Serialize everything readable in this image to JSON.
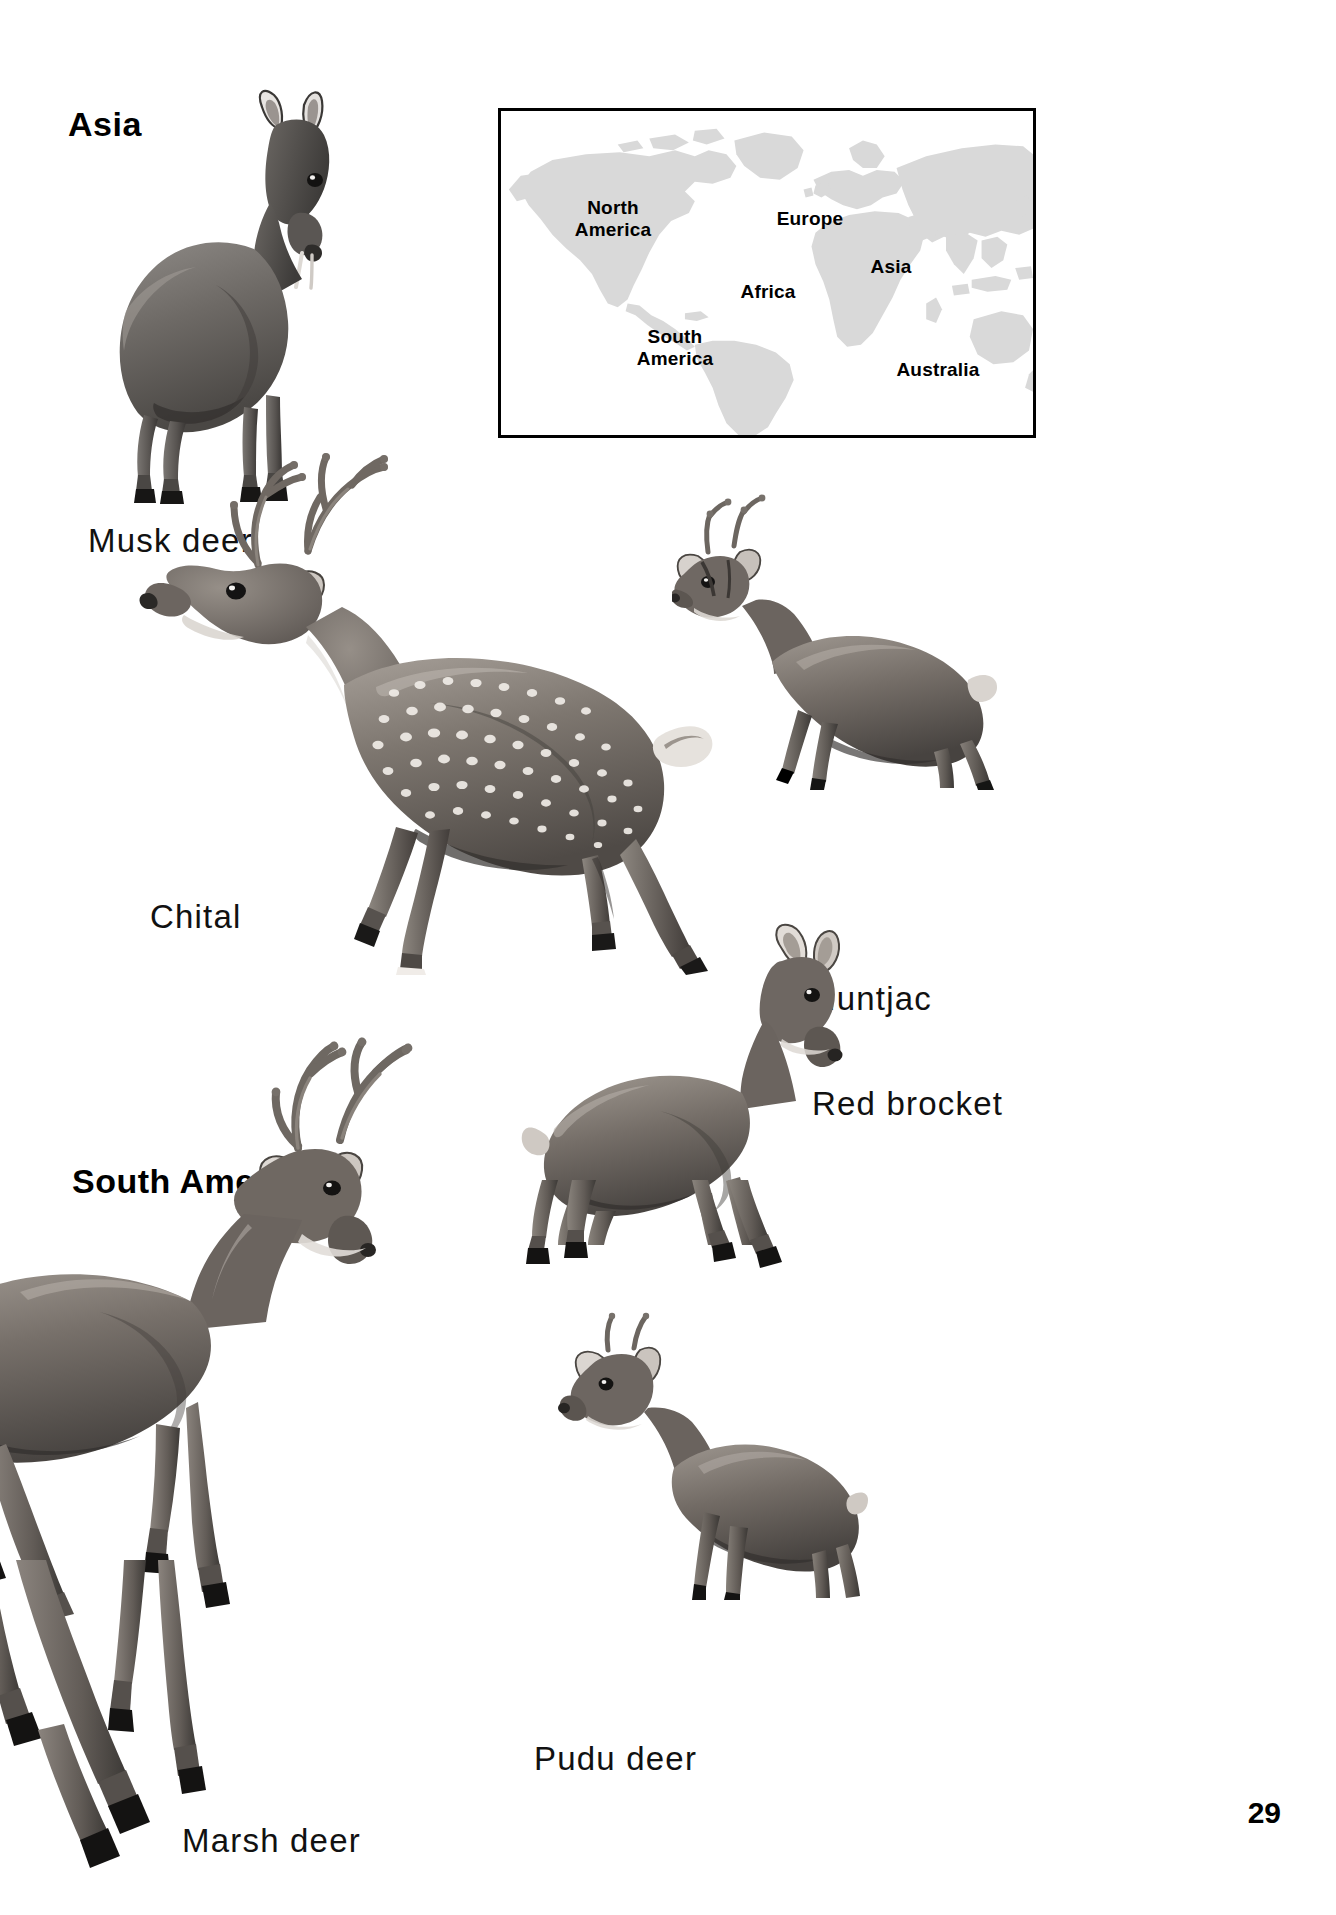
{
  "page": {
    "number": "29",
    "background_color": "#ffffff"
  },
  "headings": [
    {
      "id": "asia",
      "label": "Asia"
    },
    {
      "id": "south-america",
      "label": "South America"
    }
  ],
  "map": {
    "name": "world-map-inset",
    "border_color": "#000000",
    "land_color": "#d9d9d9",
    "ocean_color": "#ffffff",
    "labels": [
      {
        "id": "north-america",
        "text": "North\nAmerica"
      },
      {
        "id": "europe",
        "text": "Europe"
      },
      {
        "id": "asia",
        "text": "Asia"
      },
      {
        "id": "africa",
        "text": "Africa"
      },
      {
        "id": "south-america",
        "text": "South\nAmerica"
      },
      {
        "id": "australia",
        "text": "Australia"
      }
    ]
  },
  "species": [
    {
      "id": "musk-deer",
      "label": "Musk deer",
      "region": "Asia"
    },
    {
      "id": "chital",
      "label": "Chital",
      "region": "Asia"
    },
    {
      "id": "muntjac",
      "label": "Muntjac",
      "region": "Asia"
    },
    {
      "id": "red-brocket",
      "label": "Red brocket",
      "region": "South America"
    },
    {
      "id": "marsh-deer",
      "label": "Marsh deer",
      "region": "South America"
    },
    {
      "id": "pudu-deer",
      "label": "Pudu deer",
      "region": "South America"
    }
  ]
}
